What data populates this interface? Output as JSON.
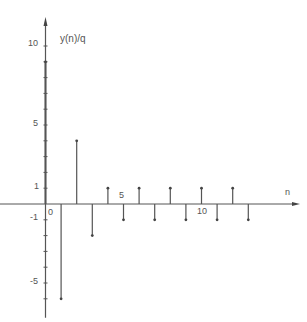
{
  "chart_data": {
    "type": "stem",
    "title": "",
    "xlabel": "n",
    "ylabel": "y(n)/q",
    "x": [
      0,
      1,
      2,
      3,
      4,
      5,
      6,
      7,
      8,
      9,
      10,
      11,
      12,
      13
    ],
    "values": [
      9,
      -6,
      4,
      -2,
      1,
      -1,
      1,
      -1,
      1,
      -1,
      1,
      -1,
      1,
      -1
    ],
    "x_ticks": [
      "0",
      "5",
      "10"
    ],
    "y_ticks": [
      "10",
      "5",
      "1",
      "-1",
      "-5"
    ],
    "ylim": [
      -6.5,
      10.5
    ],
    "grid": false
  },
  "labels": {
    "ylabel": "y(n)/q",
    "xlabel": "n",
    "y10": "10",
    "y5": "5",
    "y1": "1",
    "ym1": "-1",
    "ym5": "-5",
    "x0": "0",
    "x5": "5",
    "x10": "10"
  }
}
